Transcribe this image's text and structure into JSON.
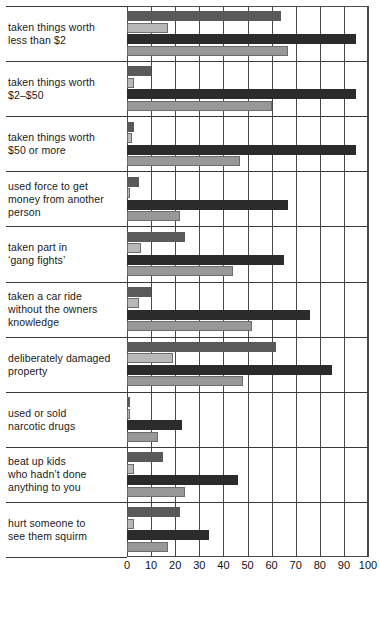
{
  "chart_data": {
    "type": "bar",
    "orientation": "horizontal",
    "title": "",
    "subtitle": "",
    "xlabel": "",
    "ylabel": "",
    "xlim": [
      0,
      100
    ],
    "grid": true,
    "legend_position": "none",
    "ticks": [
      "0",
      "10",
      "20",
      "30",
      "40",
      "50",
      "60",
      "70",
      "80",
      "90",
      "100"
    ],
    "tick_values": [
      0,
      10,
      20,
      30,
      40,
      50,
      60,
      70,
      80,
      90,
      100
    ],
    "categories": [
      "taken things worth\nless than $2",
      "taken things worth\n$2–$50",
      "taken things worth\n$50 or more",
      "used force to get\nmoney from another\nperson",
      "taken part in\n‘gang fights’",
      "taken a car ride\nwithout the owners\nknowledge",
      "deliberately damaged\nproperty",
      "used or sold\nnarcotic drugs",
      "beat up kids\nwho hadn’t done\nanything to you",
      "hurt someone to\nsee them squirm"
    ],
    "category_labels": [
      [
        "taken things worth",
        "less than $2"
      ],
      [
        "taken things worth",
        "$2–$50"
      ],
      [
        "taken things worth",
        "$50 or more"
      ],
      [
        "used force to get",
        "money from another",
        "person"
      ],
      [
        "taken part in",
        "‘gang fights’"
      ],
      [
        "taken a car ride",
        "without the owners",
        "knowledge"
      ],
      [
        "deliberately damaged",
        "property"
      ],
      [
        "used or sold",
        "narcotic drugs"
      ],
      [
        "beat up kids",
        "who hadn’t done",
        "anything to you"
      ],
      [
        "hurt someone to",
        "see them squirm"
      ]
    ],
    "series": [
      {
        "name": "series-1",
        "color": "#5a5a5a",
        "values": [
          64,
          10,
          3,
          5,
          24,
          10,
          62,
          1,
          15,
          22
        ]
      },
      {
        "name": "series-2",
        "color": "#b8b8b8",
        "values": [
          17,
          3,
          2,
          1,
          6,
          5,
          19,
          1,
          3,
          3
        ]
      },
      {
        "name": "series-3",
        "color": "#2b2b2b",
        "values": [
          95,
          95,
          95,
          67,
          65,
          76,
          85,
          23,
          46,
          34
        ]
      },
      {
        "name": "series-4",
        "color": "#989898",
        "values": [
          67,
          60,
          47,
          22,
          44,
          52,
          48,
          13,
          24,
          17
        ]
      }
    ]
  }
}
